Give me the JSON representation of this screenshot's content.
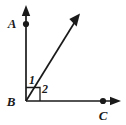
{
  "figure": {
    "background_color": "#ffffff",
    "stroke_color": "#1a1a1a",
    "points": [
      {
        "id": "A",
        "label": "A",
        "x": 26,
        "y": 24,
        "label_x": 12,
        "label_y": 27,
        "has_dot": true
      },
      {
        "id": "B",
        "label": "B",
        "x": 26,
        "y": 101,
        "label_x": 9,
        "label_y": 105,
        "has_dot": false
      },
      {
        "id": "C",
        "label": "C",
        "x": 103,
        "y": 101,
        "label_x": 99,
        "label_y": 119,
        "has_dot": true
      }
    ],
    "angles": [
      {
        "id": "1",
        "label": "1",
        "label_x": 28,
        "label_y": 84,
        "description": "angle between ray BA and diagonal ray"
      },
      {
        "id": "2",
        "label": "2",
        "label_x": 40,
        "label_y": 93,
        "description": "angle between diagonal ray and ray BC"
      }
    ],
    "rays": [
      {
        "id": "ray-BA",
        "from": "B",
        "direction": "up",
        "x1": 26,
        "y1": 101,
        "x2": 26,
        "y2": 12,
        "arrow": true
      },
      {
        "id": "ray-BD",
        "from": "B",
        "direction": "up-right",
        "x1": 26,
        "y1": 101,
        "x2": 78,
        "y2": 16,
        "arrow": true
      },
      {
        "id": "ray-BC",
        "from": "B",
        "direction": "right",
        "x1": 26,
        "y1": 101,
        "x2": 120,
        "y2": 101,
        "arrow": true
      }
    ],
    "right_angle_marker": {
      "present": true,
      "vertex": "B",
      "size": 14,
      "description": "square mark at vertex B indicating angle ABC is 90 degrees"
    }
  }
}
